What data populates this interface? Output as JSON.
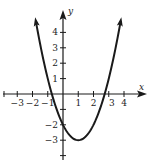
{
  "chart_data": {
    "type": "line",
    "title": "",
    "xlabel": "x",
    "ylabel": "y",
    "function": "y = x^2 - 2x - 2",
    "vertex": [
      1,
      -3
    ],
    "y_intercept": -2,
    "x_intercepts": [
      -0.73,
      2.73
    ],
    "xlim": [
      -4,
      5
    ],
    "ylim": [
      -4,
      5
    ],
    "x_ticks": [
      -3,
      -2,
      -1,
      1,
      2,
      3,
      4
    ],
    "y_ticks": [
      -3,
      -2,
      1,
      2,
      3,
      4
    ],
    "x_tick_labels": [
      "−3",
      "−2",
      "−1",
      "1",
      "2",
      "3",
      "4"
    ],
    "y_tick_labels": [
      "−3",
      "−2",
      "1",
      "2",
      "3",
      "4"
    ],
    "grid": false,
    "series": [
      {
        "name": "parabola",
        "x": [
          -1.8,
          -1.5,
          -1,
          -0.5,
          0,
          0.5,
          1,
          1.5,
          2,
          2.5,
          3,
          3.5,
          3.8
        ],
        "values": [
          4.84,
          3.25,
          1,
          -0.75,
          -2,
          -2.75,
          -3,
          -2.75,
          -2,
          -0.75,
          1,
          3.25,
          4.84
        ]
      }
    ],
    "color": "#1a1a1a"
  }
}
